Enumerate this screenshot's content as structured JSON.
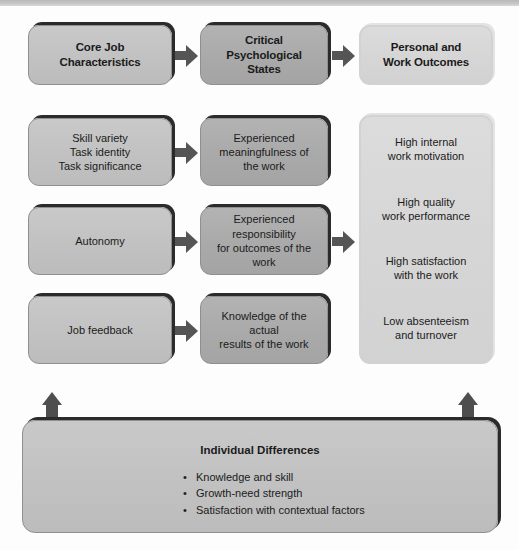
{
  "diagram": {
    "colors": {
      "box_light": "#c2c2c2",
      "box_mid": "#aaaaaa",
      "box_pale": "#d6d6d6",
      "edge_dark": "#2b2b2b",
      "arrow": "#555555",
      "text": "#1b1b1b"
    },
    "headers": [
      {
        "label": "Core Job\nCharacteristics",
        "line1": "Core Job",
        "line2": "Characteristics"
      },
      {
        "label": "Critical Psychological States",
        "line1": "Critical",
        "line2": "Psychological",
        "line3": "States"
      },
      {
        "label": "Personal and Work Outcomes",
        "line1": "Personal and",
        "line2": "Work Outcomes"
      }
    ],
    "core_job_characteristics": [
      {
        "line1": "Skill variety",
        "line2": "Task identity",
        "line3": "Task significance"
      },
      {
        "line1": "Autonomy"
      },
      {
        "line1": "Job feedback"
      }
    ],
    "critical_psychological_states": [
      {
        "line1": "Experienced",
        "line2": "meaningfulness of",
        "line3": "the work"
      },
      {
        "line1": "Experienced responsibility",
        "line2": "for outcomes of the work"
      },
      {
        "line1": "Knowledge of the actual",
        "line2": "results of the work"
      }
    ],
    "personal_and_work_outcomes": [
      {
        "line1": "High internal",
        "line2": "work motivation"
      },
      {
        "line1": "High quality",
        "line2": "work performance"
      },
      {
        "line1": "High satisfaction",
        "line2": "with the work"
      },
      {
        "line1": "Low absenteeism",
        "line2": "and turnover"
      }
    ],
    "moderators": {
      "title": "Individual Differences",
      "items": [
        "Knowledge and skill",
        "Growth-need strength",
        "Satisfaction with contextual factors"
      ],
      "bullet": "•"
    }
  }
}
